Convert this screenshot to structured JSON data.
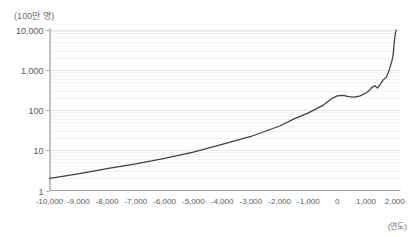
{
  "chart_data": {
    "type": "line",
    "title": "",
    "subtitle": "",
    "xlabel": "(연도)",
    "ylabel": "(100만 명)",
    "yscale": "log",
    "xscale": "linear",
    "xlim": [
      -10000,
      2200
    ],
    "ylim": [
      1,
      10000
    ],
    "grid": true,
    "grid_minor": true,
    "legend": "none",
    "xticks": [
      -10000,
      -9000,
      -8000,
      -7000,
      -6000,
      -5000,
      -4000,
      -3000,
      -2000,
      -1000,
      0,
      1000,
      2000
    ],
    "xticklabels": [
      "-10,000",
      "-9,000",
      "-8,000",
      "-7,000",
      "-6,000",
      "-5,000",
      "-4,000",
      "-3,000",
      "-2,000",
      "-1,000",
      "0",
      "1,000",
      "2,000"
    ],
    "yticks": [
      1,
      10,
      100,
      1000,
      10000
    ],
    "yticklabels": [
      "1",
      "10",
      "100",
      "1,000",
      "10,000"
    ],
    "series": [
      {
        "name": "세계 인구",
        "color": "#3f3f3f",
        "x": [
          -10000,
          -9000,
          -8000,
          -7000,
          -6000,
          -5000,
          -4000,
          -3000,
          -2000,
          -1500,
          -1000,
          -500,
          -200,
          0,
          200,
          400,
          600,
          800,
          1000,
          1100,
          1200,
          1300,
          1400,
          1500,
          1600,
          1700,
          1750,
          1800,
          1850,
          1900,
          1927,
          1950,
          1960,
          1974,
          1987,
          1999,
          2011,
          2022,
          2050
        ],
        "y": [
          2.0,
          2.6,
          3.5,
          4.6,
          6.3,
          9.0,
          14.0,
          22.0,
          40.0,
          60.0,
          85.0,
          130.0,
          190.0,
          225.0,
          230.0,
          215.0,
          210.0,
          225.0,
          265.0,
          300.0,
          360.0,
          400.0,
          350.0,
          440.0,
          560.0,
          640.0,
          770.0,
          950.0,
          1250.0,
          1650.0,
          2000.0,
          2540.0,
          3030.0,
          4000.0,
          5000.0,
          6000.0,
          7000.0,
          8000.0,
          9700.0
        ]
      }
    ]
  },
  "axes": {
    "tick_color": "#58595b",
    "spine_color": "#a6a8ab",
    "grid_major_color": "#e6e7e8",
    "grid_minor_color": "#f1f2f2"
  }
}
